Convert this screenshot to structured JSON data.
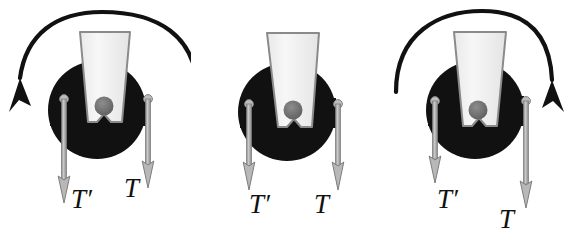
{
  "figure": {
    "title": "Rotating pulley with two tension forces",
    "background_color": "#ffffff",
    "panel_count": 3
  },
  "colors": {
    "disc": "#111111",
    "cone_fill": "#f2f2f2",
    "cone_edge": "#8a8a8a",
    "axle": "#6b6b6b",
    "rod": "#a8a8a8",
    "rod_edge": "#7d7d7d",
    "arc": "#111111",
    "label": "#111111"
  },
  "panels": [
    {
      "id": "panel-1",
      "name": "panel-ccw-rotation",
      "rotation": {
        "present": true,
        "direction": "counterclockwise",
        "arrowhead": "bottom-left",
        "label": "counterclockwise-rotation-arc"
      },
      "disc": {
        "label": "pulley-disc"
      },
      "axle": {
        "label": "axle-dot"
      },
      "cone": {
        "label": "cone-bracket"
      },
      "forces": [
        {
          "key": "left",
          "label": "T′",
          "name": "tension-label-t-prime",
          "length": "long"
        },
        {
          "key": "right",
          "label": "T",
          "name": "tension-label-t",
          "length": "short"
        }
      ]
    },
    {
      "id": "panel-2",
      "name": "panel-no-rotation",
      "rotation": {
        "present": false,
        "direction": "none",
        "arrowhead": "none",
        "label": "no-rotation-arc"
      },
      "disc": {
        "label": "pulley-disc"
      },
      "axle": {
        "label": "axle-dot"
      },
      "cone": {
        "label": "cone-bracket"
      },
      "forces": [
        {
          "key": "left",
          "label": "T′",
          "name": "tension-label-t-prime",
          "length": "equal"
        },
        {
          "key": "right",
          "label": "T",
          "name": "tension-label-t",
          "length": "equal"
        }
      ]
    },
    {
      "id": "panel-3",
      "name": "panel-cw-rotation",
      "rotation": {
        "present": true,
        "direction": "clockwise",
        "arrowhead": "bottom-right",
        "label": "clockwise-rotation-arc"
      },
      "disc": {
        "label": "pulley-disc"
      },
      "axle": {
        "label": "axle-dot"
      },
      "cone": {
        "label": "cone-bracket"
      },
      "forces": [
        {
          "key": "left",
          "label": "T′",
          "name": "tension-label-t-prime",
          "length": "short"
        },
        {
          "key": "right",
          "label": "T",
          "name": "tension-label-t",
          "length": "long"
        }
      ]
    }
  ]
}
